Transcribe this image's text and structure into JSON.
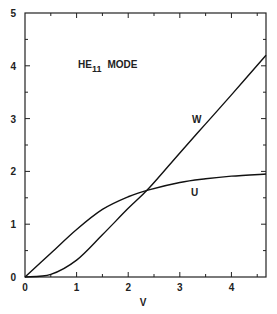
{
  "chart_data": {
    "type": "line",
    "title_main": "HE",
    "title_sub": "11",
    "title_suffix": "MODE",
    "xlabel": "V",
    "ylabel": "",
    "xlim": [
      0,
      4.67
    ],
    "ylim": [
      0,
      5
    ],
    "xticks": [
      "0",
      "1",
      "2",
      "3",
      "4"
    ],
    "yticks": [
      "0",
      "1",
      "2",
      "3",
      "4",
      "5"
    ],
    "grid": false,
    "legend": "inline labels",
    "series": [
      {
        "name": "W",
        "x": [
          0,
          0.5,
          1.0,
          1.5,
          2.0,
          2.4,
          3.0,
          3.5,
          4.0,
          4.67
        ],
        "values": [
          0,
          0.05,
          0.32,
          0.8,
          1.3,
          1.68,
          2.35,
          2.9,
          3.45,
          4.2
        ]
      },
      {
        "name": "U",
        "x": [
          0,
          0.5,
          1.0,
          1.5,
          2.0,
          2.4,
          3.0,
          3.5,
          4.0,
          4.67
        ],
        "values": [
          0,
          0.45,
          0.9,
          1.28,
          1.52,
          1.65,
          1.79,
          1.86,
          1.91,
          1.95
        ]
      }
    ]
  }
}
